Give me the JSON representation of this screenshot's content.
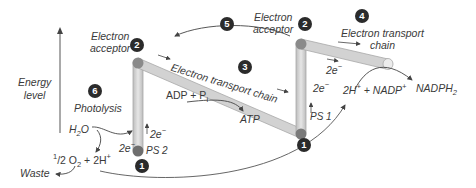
{
  "axis": {
    "label_line1": "Energy",
    "label_line2": "level"
  },
  "steps": {
    "ps2_badge": "1",
    "ps1_badge": "1",
    "acceptor1_badge": "2",
    "acceptor2_badge": "2",
    "etc1_badge": "3",
    "etc2_badge": "4",
    "cyclic_badge": "5",
    "photolysis_badge": "6"
  },
  "labels": {
    "acceptor1_line1": "Electron",
    "acceptor1_line2": "acceptor",
    "acceptor2_line1": "Electron",
    "acceptor2_line2": "acceptor",
    "etc1": "Electron transport chain",
    "etc2_line1": "Electron transport",
    "etc2_line2": "chain",
    "photolysis": "Photolysis",
    "ps2": "PS 2",
    "ps1": "PS 1",
    "adp": "ADP + P",
    "adp_sub": "i",
    "atp": "ATP",
    "h2o_h": "H",
    "h2o_sub": "2",
    "h2o_o": "O",
    "electrons_2e": "2e",
    "electron_sup": "−",
    "half": "1",
    "half_rest": "/2 O",
    "o2_sub": "2",
    "plus_2h": " + 2H",
    "plus_sup": "+",
    "waste": "Waste",
    "nadp_left": "2H",
    "nadp_mid": " + NADP",
    "nadph": "NADPH",
    "nadph_sub": "2"
  },
  "colors": {
    "tube_fill": "#d4d4d4",
    "tube_edge": "#a8a8a8",
    "node": "#7a7a7a",
    "badge": "#2b2b2b",
    "arrow": "#444444"
  }
}
